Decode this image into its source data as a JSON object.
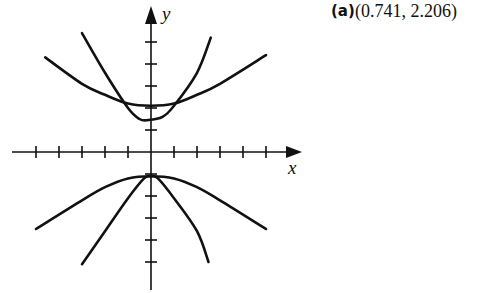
{
  "answer": {
    "part_label": "(a)",
    "coordinates": "(0.741, 2.206)"
  },
  "axes": {
    "x_label": "x",
    "y_label": "y",
    "origin_px": [
      151,
      152
    ],
    "unit_px_x": 23,
    "unit_px_y": 22,
    "x_ticks": [
      -5,
      -4,
      -3,
      -2,
      -1,
      1,
      2,
      3,
      4,
      5
    ],
    "y_ticks": [
      -5,
      -4,
      -3,
      -2,
      -1,
      1,
      2,
      3,
      4,
      5
    ]
  },
  "chart_data": {
    "type": "line",
    "title": "",
    "xlabel": "x",
    "ylabel": "y",
    "xlim": [
      -6,
      6
    ],
    "ylim": [
      -6,
      6
    ],
    "grid": false,
    "series": [
      {
        "name": "upper-wide curve",
        "x": [
          -4.6,
          -3,
          -2,
          -1,
          0,
          1,
          2,
          3,
          5.0
        ],
        "y": [
          4.3,
          3.1,
          2.6,
          2.2,
          2.1,
          2.2,
          2.6,
          3.1,
          4.4
        ]
      },
      {
        "name": "upper-narrow curve",
        "x": [
          -3.0,
          -2,
          -1,
          -0.5,
          -0.13,
          0.5,
          1,
          2,
          2.6
        ],
        "y": [
          5.4,
          3.6,
          2.0,
          1.5,
          1.45,
          1.6,
          2.1,
          3.6,
          5.2
        ]
      },
      {
        "name": "lower-wide curve",
        "x": [
          -5.0,
          -3,
          -2,
          -1,
          0,
          1,
          2,
          3,
          5.0
        ],
        "y": [
          -3.5,
          -2.2,
          -1.6,
          -1.2,
          -1.1,
          -1.2,
          -1.6,
          -2.2,
          -3.5
        ]
      },
      {
        "name": "lower-narrow curve",
        "x": [
          -3.0,
          -2,
          -1,
          -0.3,
          0,
          0.3,
          1,
          2,
          2.5
        ],
        "y": [
          -5.1,
          -3.6,
          -2.1,
          -1.2,
          -1.1,
          -1.2,
          -2.1,
          -3.6,
          -5.0
        ]
      }
    ],
    "annotations": [
      "(a) (0.741, 2.206)"
    ]
  }
}
